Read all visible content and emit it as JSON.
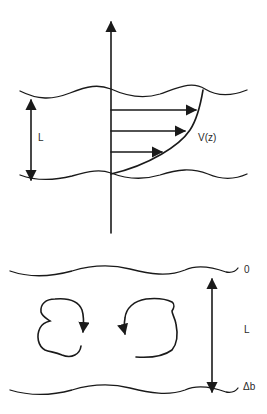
{
  "diagram": {
    "top_panel": {
      "thickness_label": "L",
      "profile_label": "V(z)",
      "velocity_arrows": 3
    },
    "bottom_panel": {
      "top_level_label": "0",
      "thickness_label": "L",
      "bottom_level_label": "Δb",
      "eddies": [
        "clockwise-eddy",
        "counterclockwise-eddy"
      ]
    },
    "colors": {
      "stroke": "#1a1a1a",
      "background": "#ffffff"
    }
  }
}
